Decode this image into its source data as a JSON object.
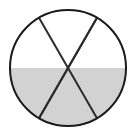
{
  "figure": {
    "name": "fraction-circle-sixths",
    "type": "pie",
    "title": "",
    "canvas": {
      "width": 137,
      "height": 140,
      "background": "#ffffff"
    },
    "circle": {
      "center_x": 68,
      "center_y": 68,
      "radius": 58,
      "stroke_color": "#1a1a1a",
      "stroke_width": 2,
      "unshaded_fill": "#ffffff"
    },
    "divisions": {
      "count": 6,
      "sector_angle_degrees": 60,
      "divider_lines": 3,
      "divider_stroke_color": "#2b2b2b",
      "divider_stroke_width": 2,
      "divider_angles_degrees": [
        0,
        60,
        120
      ]
    },
    "shading": {
      "shaded_fill": "#d2d2d2",
      "shaded_sectors": 3,
      "total_sectors": 6,
      "fraction_label": "3/6",
      "simplified_fraction": "1/2",
      "shaded_region": "bottom-half"
    },
    "sectors": [
      {
        "index": 1,
        "start_angle": 0,
        "end_angle": 60,
        "position": "upper-right",
        "shaded": false,
        "fill": "#ffffff"
      },
      {
        "index": 2,
        "start_angle": 60,
        "end_angle": 120,
        "position": "top",
        "shaded": false,
        "fill": "#ffffff"
      },
      {
        "index": 3,
        "start_angle": 120,
        "end_angle": 180,
        "position": "upper-left",
        "shaded": false,
        "fill": "#ffffff"
      },
      {
        "index": 4,
        "start_angle": 180,
        "end_angle": 240,
        "position": "lower-left",
        "shaded": true,
        "fill": "#d2d2d2"
      },
      {
        "index": 5,
        "start_angle": 240,
        "end_angle": 300,
        "position": "bottom",
        "shaded": true,
        "fill": "#d2d2d2"
      },
      {
        "index": 6,
        "start_angle": 300,
        "end_angle": 360,
        "position": "lower-right",
        "shaded": true,
        "fill": "#d2d2d2"
      }
    ]
  },
  "chart_data": {
    "type": "pie",
    "title": "",
    "xlabel": "",
    "ylabel": "",
    "categories": [
      "sector-1",
      "sector-2",
      "sector-3",
      "sector-4",
      "sector-5",
      "sector-6"
    ],
    "values": [
      1,
      1,
      1,
      1,
      1,
      1
    ],
    "shaded": [
      false,
      false,
      false,
      true,
      true,
      true
    ],
    "colors": [
      "#ffffff",
      "#ffffff",
      "#ffffff",
      "#d2d2d2",
      "#d2d2d2",
      "#d2d2d2"
    ],
    "legend": [],
    "annotations": [],
    "grid": false,
    "legend_position": "none"
  }
}
